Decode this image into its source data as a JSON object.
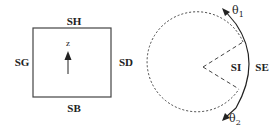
{
  "square_panel": {
    "labels": {
      "top": "SH",
      "bottom": "SB",
      "left": "SG",
      "right": "SD"
    },
    "axis_label": "z"
  },
  "circle_panel": {
    "labels": {
      "inner": "SI",
      "outer": "SE"
    },
    "angle_top": {
      "symbol": "θ",
      "subscript": "1"
    },
    "angle_bottom": {
      "symbol": "θ",
      "subscript": "2"
    }
  },
  "colors": {
    "stroke": "#333333",
    "text": "#222222"
  }
}
